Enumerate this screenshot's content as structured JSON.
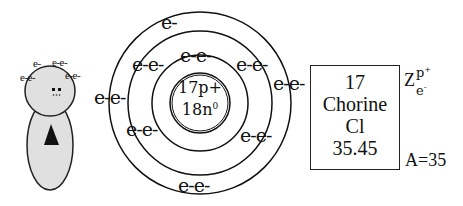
{
  "figure": {
    "head_electrons": [
      "e-",
      "e-e-",
      "e-e-",
      "e-e-"
    ],
    "body_symbol": "triangle",
    "fill_color": "#e0e0e0"
  },
  "atom_model": {
    "nucleus": {
      "protons": "17p+",
      "neutrons_base": "18n",
      "neutrons_sup": "0"
    },
    "shells": [
      {
        "name": "shell-1",
        "electrons": [
          "e-e-"
        ],
        "count": 2
      },
      {
        "name": "shell-2",
        "electrons": [
          "e-e-",
          "e-e-",
          "e-e-",
          "e-e-"
        ],
        "count": 8
      },
      {
        "name": "shell-3",
        "electrons": [
          "e-",
          "e-e-",
          "e-e-",
          "e-e-"
        ],
        "count": 7
      }
    ],
    "labels": {
      "top": "e-",
      "inner_top": "e-e-",
      "mid_top_left": "e-e-",
      "mid_top_right": "e-e-",
      "outer_left": "e-e-",
      "outer_right": "e-e-",
      "mid_bottom_left": "e-e-",
      "mid_bottom_right": "e-e-",
      "bottom": "e-e-"
    }
  },
  "element_card": {
    "atomic_number": "17",
    "name": "Chorine",
    "symbol": "Cl",
    "atomic_mass": "35.45"
  },
  "annotations": {
    "z_label": "Z",
    "z_proton": "p",
    "z_proton_sup": "+",
    "z_electron": "e",
    "z_electron_sup": "-",
    "mass_number": "A=35"
  }
}
